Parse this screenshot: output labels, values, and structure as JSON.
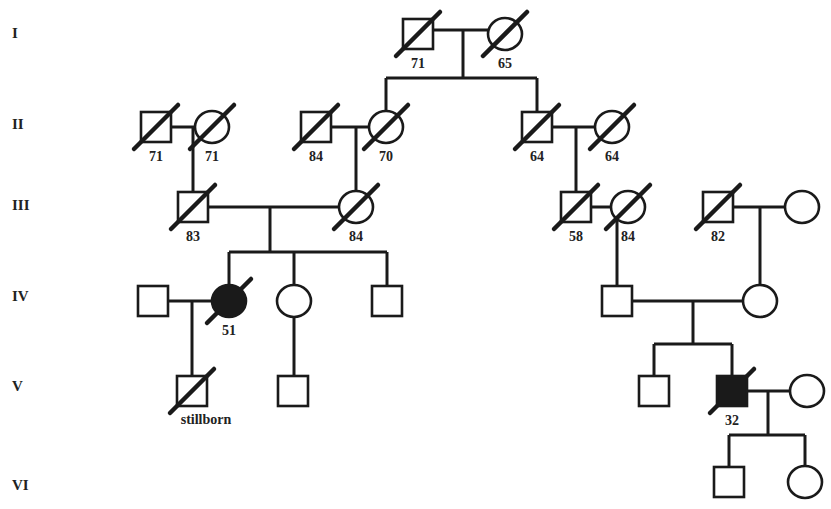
{
  "generations": [
    "I",
    "II",
    "III",
    "IV",
    "V",
    "VI"
  ],
  "individuals": [
    {
      "id": "I-1",
      "generation": "I",
      "sex": "male",
      "deceased": true,
      "affected": false,
      "label": "71"
    },
    {
      "id": "I-2",
      "generation": "I",
      "sex": "female",
      "deceased": true,
      "affected": false,
      "label": "65"
    },
    {
      "id": "II-1",
      "generation": "II",
      "sex": "male",
      "deceased": true,
      "affected": false,
      "label": "71"
    },
    {
      "id": "II-2",
      "generation": "II",
      "sex": "female",
      "deceased": true,
      "affected": false,
      "label": "71"
    },
    {
      "id": "II-3",
      "generation": "II",
      "sex": "male",
      "deceased": true,
      "affected": false,
      "label": "84"
    },
    {
      "id": "II-4",
      "generation": "II",
      "sex": "female",
      "deceased": true,
      "affected": false,
      "label": "70"
    },
    {
      "id": "II-5",
      "generation": "II",
      "sex": "male",
      "deceased": true,
      "affected": false,
      "label": "64"
    },
    {
      "id": "II-6",
      "generation": "II",
      "sex": "female",
      "deceased": true,
      "affected": false,
      "label": "64"
    },
    {
      "id": "III-1",
      "generation": "III",
      "sex": "male",
      "deceased": true,
      "affected": false,
      "label": "83"
    },
    {
      "id": "III-2",
      "generation": "III",
      "sex": "female",
      "deceased": true,
      "affected": false,
      "label": "84"
    },
    {
      "id": "III-3",
      "generation": "III",
      "sex": "male",
      "deceased": true,
      "affected": false,
      "label": "58"
    },
    {
      "id": "III-4",
      "generation": "III",
      "sex": "female",
      "deceased": true,
      "affected": false,
      "label": "84"
    },
    {
      "id": "III-5",
      "generation": "III",
      "sex": "male",
      "deceased": true,
      "affected": false,
      "label": "82"
    },
    {
      "id": "III-6",
      "generation": "III",
      "sex": "female",
      "deceased": false,
      "affected": false,
      "label": ""
    },
    {
      "id": "IV-1",
      "generation": "IV",
      "sex": "male",
      "deceased": false,
      "affected": false,
      "label": ""
    },
    {
      "id": "IV-2",
      "generation": "IV",
      "sex": "female",
      "deceased": true,
      "affected": true,
      "label": "51"
    },
    {
      "id": "IV-3",
      "generation": "IV",
      "sex": "female",
      "deceased": false,
      "affected": false,
      "label": ""
    },
    {
      "id": "IV-4",
      "generation": "IV",
      "sex": "male",
      "deceased": false,
      "affected": false,
      "label": ""
    },
    {
      "id": "IV-5",
      "generation": "IV",
      "sex": "male",
      "deceased": false,
      "affected": false,
      "label": ""
    },
    {
      "id": "IV-6",
      "generation": "IV",
      "sex": "female",
      "deceased": false,
      "affected": false,
      "label": ""
    },
    {
      "id": "V-1",
      "generation": "V",
      "sex": "male",
      "deceased": true,
      "affected": false,
      "label": "stillborn"
    },
    {
      "id": "V-2",
      "generation": "V",
      "sex": "male",
      "deceased": false,
      "affected": false,
      "label": ""
    },
    {
      "id": "V-3",
      "generation": "V",
      "sex": "male",
      "deceased": false,
      "affected": false,
      "label": ""
    },
    {
      "id": "V-4",
      "generation": "V",
      "sex": "male",
      "deceased": true,
      "affected": true,
      "label": "32"
    },
    {
      "id": "V-5",
      "generation": "V",
      "sex": "female",
      "deceased": false,
      "affected": false,
      "label": ""
    },
    {
      "id": "VI-1",
      "generation": "VI",
      "sex": "male",
      "deceased": false,
      "affected": false,
      "label": ""
    },
    {
      "id": "VI-2",
      "generation": "VI",
      "sex": "female",
      "deceased": false,
      "affected": false,
      "label": ""
    }
  ],
  "unions": [
    {
      "partners": [
        "I-1",
        "I-2"
      ],
      "children": [
        "II-4",
        "II-5"
      ]
    },
    {
      "partners": [
        "II-1",
        "II-2"
      ],
      "children": [
        "III-1"
      ]
    },
    {
      "partners": [
        "II-3",
        "II-4"
      ],
      "children": [
        "III-2"
      ]
    },
    {
      "partners": [
        "II-5",
        "II-6"
      ],
      "children": [
        "III-3"
      ]
    },
    {
      "partners": [
        "III-1",
        "III-2"
      ],
      "children": [
        "IV-2",
        "IV-3",
        "IV-4"
      ]
    },
    {
      "partners": [
        "III-3",
        "III-4"
      ],
      "children": [
        "IV-5"
      ]
    },
    {
      "partners": [
        "III-5",
        "III-6"
      ],
      "children": [
        "IV-6"
      ]
    },
    {
      "partners": [
        "IV-1",
        "IV-2"
      ],
      "children": [
        "V-1"
      ]
    },
    {
      "partners": [
        "IV-3"
      ],
      "children": [
        "V-2"
      ]
    },
    {
      "partners": [
        "IV-5",
        "IV-6"
      ],
      "children": [
        "V-3",
        "V-4"
      ]
    },
    {
      "partners": [
        "V-4",
        "V-5"
      ],
      "children": [
        "VI-1",
        "VI-2"
      ]
    }
  ]
}
